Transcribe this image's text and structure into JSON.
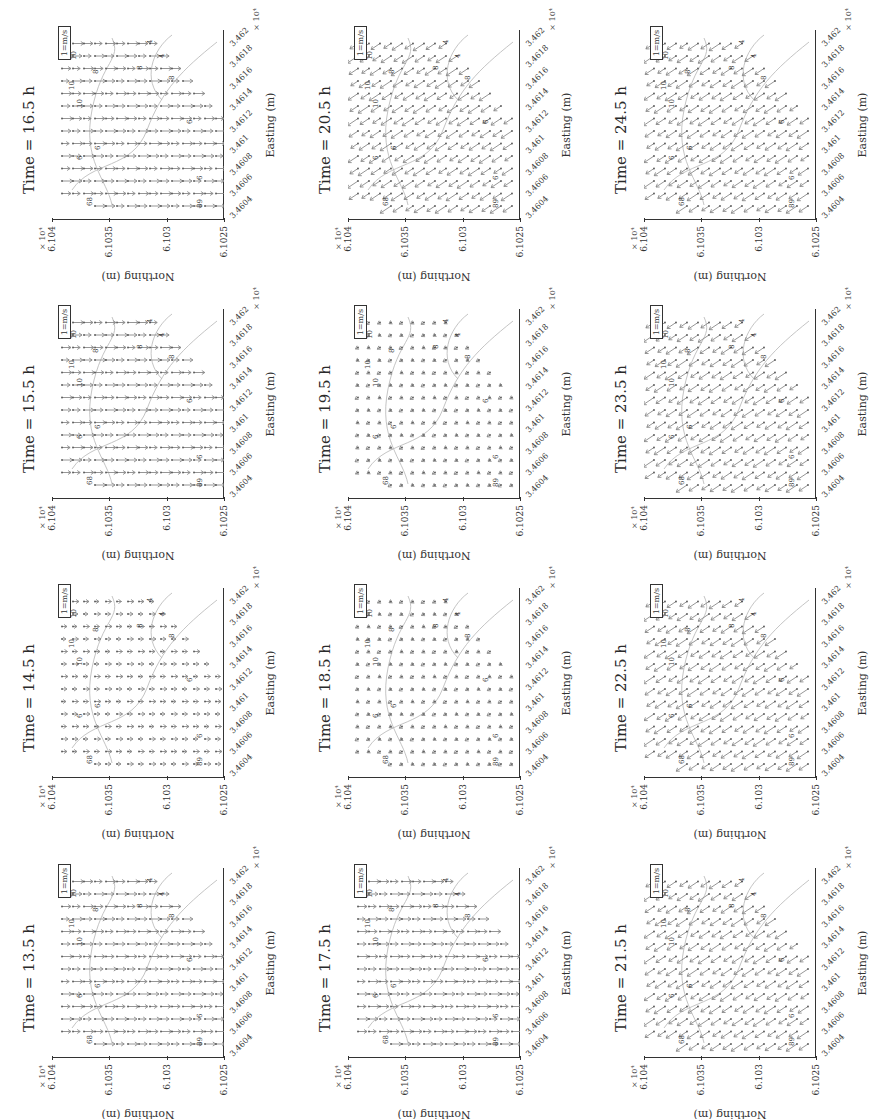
{
  "figure": {
    "orientation": "rotated -90deg (page in landscape)",
    "panels": [
      {
        "id": "p16_5",
        "title": "Time = 16.5 h",
        "display_col": 0,
        "display_band": 0,
        "flow": "down"
      },
      {
        "id": "p20_5",
        "title": "Time = 20.5 h",
        "display_col": 1,
        "display_band": 0,
        "flow": "up-left"
      },
      {
        "id": "p24_5",
        "title": "Time = 24.5 h",
        "display_col": 2,
        "display_band": 0,
        "flow": "up-left"
      },
      {
        "id": "p15_5",
        "title": "Time = 15.5 h",
        "display_col": 0,
        "display_band": 1,
        "flow": "down"
      },
      {
        "id": "p19_5",
        "title": "Time = 19.5 h",
        "display_col": 1,
        "display_band": 1,
        "flow": "weak"
      },
      {
        "id": "p23_5",
        "title": "Time = 23.5 h",
        "display_col": 2,
        "display_band": 1,
        "flow": "up-left"
      },
      {
        "id": "p14_5",
        "title": "Time = 14.5 h",
        "display_col": 0,
        "display_band": 2,
        "flow": "down-weak"
      },
      {
        "id": "p18_5",
        "title": "Time = 18.5 h",
        "display_col": 1,
        "display_band": 2,
        "flow": "weak"
      },
      {
        "id": "p22_5",
        "title": "Time = 22.5 h",
        "display_col": 2,
        "display_band": 2,
        "flow": "up-left"
      },
      {
        "id": "p13_5",
        "title": "Time = 13.5 h",
        "display_col": 0,
        "display_band": 3,
        "flow": "down"
      },
      {
        "id": "p17_5",
        "title": "Time = 17.5 h",
        "display_col": 1,
        "display_band": 3,
        "flow": "down"
      },
      {
        "id": "p21_5",
        "title": "Time = 21.5 h",
        "display_col": 2,
        "display_band": 3,
        "flow": "up-left"
      }
    ],
    "axes": {
      "xlabel": "Easting (m)",
      "ylabel": "Northing (m)",
      "xticks": [
        "3.4604",
        "3.4606",
        "3.4608",
        "3.461",
        "3.4612",
        "3.4614",
        "3.4616",
        "3.4618",
        "3.462"
      ],
      "yticks": [
        "6.104",
        "6.1035",
        "6.103",
        "6.1025"
      ],
      "x_multiplier": "× 10⁴",
      "y_multiplier": "× 10⁴"
    },
    "legend": "1=m/s",
    "contour_labels": [
      "12",
      "10",
      "10",
      "10",
      "8",
      "8",
      "8",
      "6",
      "6",
      "6",
      "6",
      "4",
      "4",
      "68",
      "89"
    ],
    "colors": {
      "arrow": "#8a8a8a",
      "contour": "#b5b5b5",
      "axis": "#333333",
      "label": "#333333"
    }
  },
  "chart_data": {
    "type": "quiver",
    "xlabel": "Easting (m)",
    "ylabel": "Northing (m)",
    "x_ticks": [
      34604,
      34606,
      34608,
      34610,
      34612,
      34614,
      34616,
      34618,
      34620
    ],
    "y_ticks": [
      6.104,
      6.1035,
      6.103,
      6.1025
    ],
    "x_multiplier": "×10^4",
    "y_multiplier": "×10^4",
    "legend": "1=m/s reference arrow",
    "panels": [
      {
        "time_h": 13.5,
        "dominant_direction": "south (ebb)",
        "relative_speed": "moderate"
      },
      {
        "time_h": 14.5,
        "dominant_direction": "south",
        "relative_speed": "weak"
      },
      {
        "time_h": 15.5,
        "dominant_direction": "south",
        "relative_speed": "moderate"
      },
      {
        "time_h": 16.5,
        "dominant_direction": "south",
        "relative_speed": "moderate"
      },
      {
        "time_h": 17.5,
        "dominant_direction": "south",
        "relative_speed": "moderate"
      },
      {
        "time_h": 18.5,
        "dominant_direction": "slack/weak",
        "relative_speed": "weak"
      },
      {
        "time_h": 19.5,
        "dominant_direction": "slack/weak northwest",
        "relative_speed": "weak"
      },
      {
        "time_h": 20.5,
        "dominant_direction": "north-northwest (flood)",
        "relative_speed": "strong"
      },
      {
        "time_h": 21.5,
        "dominant_direction": "northwest",
        "relative_speed": "moderate"
      },
      {
        "time_h": 22.5,
        "dominant_direction": "northwest",
        "relative_speed": "moderate"
      },
      {
        "time_h": 23.5,
        "dominant_direction": "northwest",
        "relative_speed": "strong"
      },
      {
        "time_h": 24.5,
        "dominant_direction": "northwest",
        "relative_speed": "moderate"
      }
    ],
    "contour_levels": [
      4,
      6,
      8,
      10,
      12
    ],
    "grid": false,
    "legend_position": "lower right (upright)"
  }
}
